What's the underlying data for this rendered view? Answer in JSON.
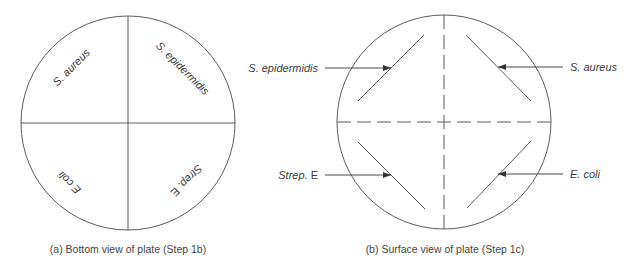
{
  "panel_a": {
    "caption": "(a) Bottom view of plate (Step 1b)",
    "quadrants": {
      "top_left": "S. aureus",
      "top_right": "S. epidermidis",
      "bottom_left": "E coli",
      "bottom_right": "Strep. E"
    }
  },
  "panel_b": {
    "caption": "(b) Surface view of plate (Step 1c)",
    "labels": {
      "top_left": {
        "species": "S. epidermidis"
      },
      "top_right": {
        "species": "S. aureus"
      },
      "bottom_left": {
        "genus": "Strep.",
        "suffix": " E"
      },
      "bottom_right": {
        "species": "E. coli"
      }
    }
  },
  "colors": {
    "line": "#4a4a4a",
    "text": "#3a3a3a",
    "background": "#ffffff"
  }
}
